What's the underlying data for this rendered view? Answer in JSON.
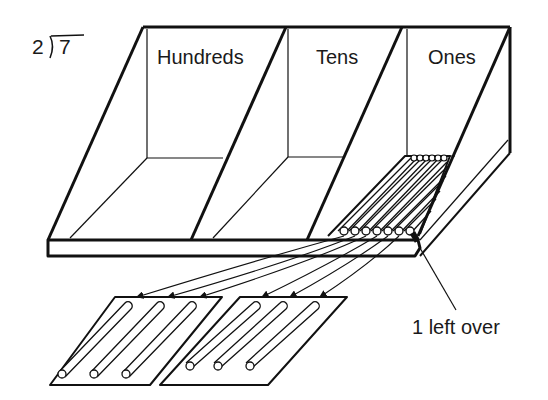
{
  "problem": {
    "divisor": "2",
    "dividend": "7",
    "notation": "2)7"
  },
  "tray": {
    "compartments": [
      {
        "label": "Hundreds",
        "count": 0
      },
      {
        "label": "Tens",
        "count": 0
      },
      {
        "label": "Ones",
        "count": 7
      }
    ]
  },
  "groups": [
    {
      "name": "group-1",
      "sticks": 3
    },
    {
      "name": "group-2",
      "sticks": 3
    }
  ],
  "remainder": {
    "label": "1 left over",
    "count": 1
  },
  "colors": {
    "ink": "#111111",
    "background": "#ffffff"
  }
}
